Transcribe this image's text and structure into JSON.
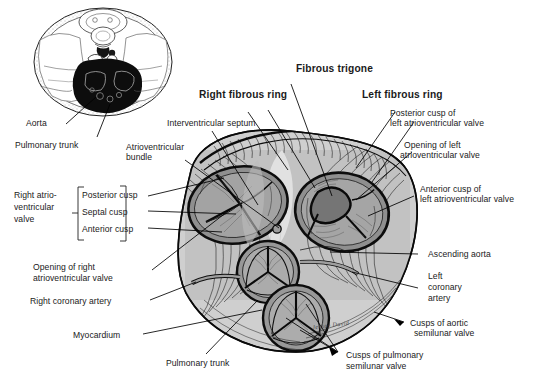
{
  "figure": {
    "signature": "Jensen  David",
    "colors": {
      "ink": "#111111",
      "label_text": "#1a1a1a",
      "valve_fill": "#9a9a9a",
      "muscle_fill": "#b9b9b9",
      "light_fill": "#d8d8d8",
      "dark_fill": "#6d6d6d",
      "background": "#ffffff"
    }
  },
  "inset": {
    "name": "thoracic-cross-section",
    "labels": [
      {
        "id": "aorta",
        "text": "Aorta"
      },
      {
        "id": "pulmonary-trunk",
        "text": "Pulmonary trunk"
      }
    ]
  },
  "labels": {
    "top": [
      {
        "id": "fibrous-trigone",
        "text": "Fibrous trigone",
        "bold": true
      },
      {
        "id": "right-fibrous-ring",
        "text": "Right fibrous ring",
        "bold": true
      },
      {
        "id": "left-fibrous-ring",
        "text": "Left fibrous ring",
        "bold": true
      },
      {
        "id": "interventricular-septum",
        "text": "Interventricular septum",
        "bold": false
      },
      {
        "id": "atrioventricular-bundle",
        "line1": "Atrioventricular",
        "line2": "bundle",
        "bold": false
      }
    ],
    "left": [
      {
        "id": "right-av-valve-group",
        "line1": "Right atrio-",
        "line2": "ventricular",
        "line3": "valve"
      },
      {
        "id": "posterior-cusp",
        "text": "Posterior cusp"
      },
      {
        "id": "septal-cusp",
        "text": "Septal cusp"
      },
      {
        "id": "anterior-cusp",
        "text": "Anterior cusp"
      },
      {
        "id": "opening-right-av-valve",
        "line1": "Opening of right",
        "line2": "atrioventricular valve"
      },
      {
        "id": "right-coronary-artery",
        "text": "Right coronary artery"
      },
      {
        "id": "myocardium",
        "text": "Myocardium"
      }
    ],
    "right": [
      {
        "id": "posterior-cusp-left-av",
        "line1": "Posterior cusp of",
        "line2": "left atrioventricular valve"
      },
      {
        "id": "opening-left-av-valve",
        "line1": "Opening of left",
        "line2": "atrioventricular valve"
      },
      {
        "id": "anterior-cusp-left-av",
        "line1": "Anterior cusp of",
        "line2": "left atrioventricular valve"
      },
      {
        "id": "ascending-aorta",
        "text": "Ascending aorta"
      },
      {
        "id": "left-coronary-artery",
        "line1": "Left",
        "line2": "coronary",
        "line3": "artery"
      },
      {
        "id": "cusps-aortic-semilunar",
        "line1": "Cusps of aortic",
        "line2": "semilunar valve"
      }
    ],
    "bottom": [
      {
        "id": "pulmonary-trunk-main",
        "text": "Pulmonary trunk"
      },
      {
        "id": "cusps-pulmonary-semilunar",
        "line1": "Cusps of pulmonary",
        "line2": "semilunar valve"
      }
    ]
  }
}
